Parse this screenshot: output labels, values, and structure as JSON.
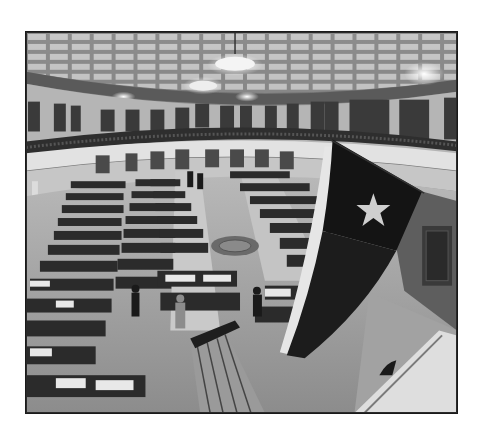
{
  "photo": {
    "description": "Black-and-white wide-angle photograph of the Texas House of Representatives chamber viewed from the gallery, with a Texas flag hanging in the foreground",
    "style": "grayscale",
    "colors": {
      "ceiling": "#d9d9d9",
      "walls": "#bdbdbd",
      "floor": "#a8a8a8",
      "desks": "#2b2b2b",
      "flag_dark": "#141414",
      "flag_light": "#e6e6e6",
      "star": "#cfcfcf",
      "frame_border": "#1a1a1a",
      "page_background": "#ffffff"
    },
    "elements": [
      "coffered-skylight-ceiling",
      "chandeliers",
      "upper-gallery-with-spectators",
      "balcony-railing",
      "rows-of-legislator-desks",
      "center-aisle",
      "floor-seal",
      "speaker-podium-stairs",
      "texas-flag-with-lone-star",
      "foreground-balcony-edge"
    ]
  }
}
